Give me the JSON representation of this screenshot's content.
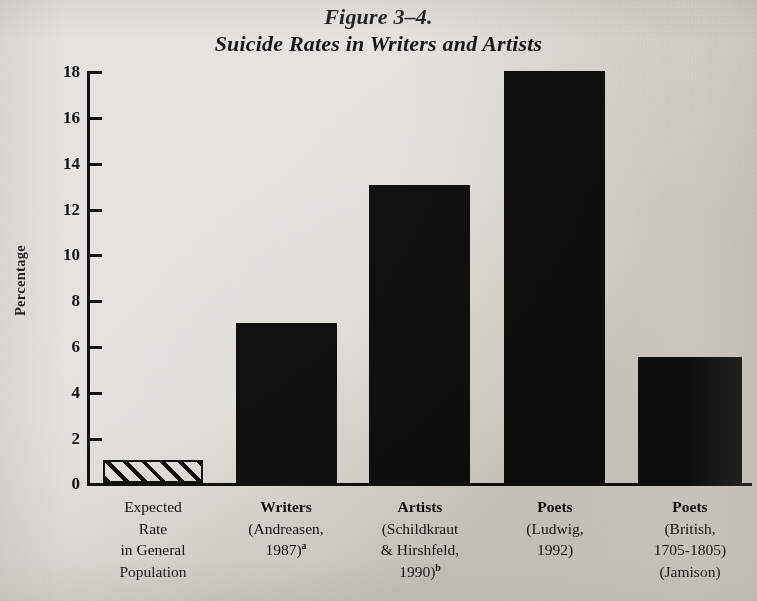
{
  "figure": {
    "title_line1": "Figure 3–4.",
    "title_line2": "Suicide Rates in Writers and Artists"
  },
  "axes": {
    "ylabel": "Percentage",
    "ytick_labels": [
      "18",
      "16",
      "14",
      "12",
      "10",
      "8",
      "6",
      "4",
      "2",
      "0"
    ]
  },
  "categories": [
    {
      "lines": [
        "Expected",
        "Rate",
        "in General",
        "Population"
      ],
      "bold_first": false,
      "superscript": ""
    },
    {
      "lines": [
        "Writers",
        "(Andreasen,",
        "1987)"
      ],
      "bold_first": true,
      "superscript": "a"
    },
    {
      "lines": [
        "Artists",
        "(Schildkraut",
        "& Hirshfeld,",
        "1990)"
      ],
      "bold_first": true,
      "superscript": "b"
    },
    {
      "lines": [
        "Poets",
        "(Ludwig,",
        "1992)"
      ],
      "bold_first": true,
      "superscript": ""
    },
    {
      "lines": [
        "Poets",
        "(British,",
        "1705-1805)",
        "(Jamison)"
      ],
      "bold_first": true,
      "superscript": ""
    }
  ],
  "colors": {
    "paper": "#eceae6",
    "ink": "#121212",
    "bar_fill": "#101010"
  },
  "chart_data": {
    "type": "bar",
    "title": "Figure 3–4. Suicide Rates in Writers and Artists",
    "xlabel": "",
    "ylabel": "Percentage",
    "ylim": [
      0,
      18
    ],
    "yticks": [
      0,
      2,
      4,
      6,
      8,
      10,
      12,
      14,
      16,
      18
    ],
    "grid": false,
    "legend": false,
    "categories": [
      "Expected Rate in General Population",
      "Writers (Andreasen, 1987)a",
      "Artists (Schildkraut & Hirshfeld, 1990)b",
      "Poets (Ludwig, 1992)",
      "Poets (British, 1705-1805) (Jamison)"
    ],
    "values": [
      1,
      7,
      13,
      18,
      5.5
    ],
    "bar_styles": [
      "hatched",
      "solid",
      "solid",
      "solid",
      "solid"
    ],
    "units": "percent"
  }
}
